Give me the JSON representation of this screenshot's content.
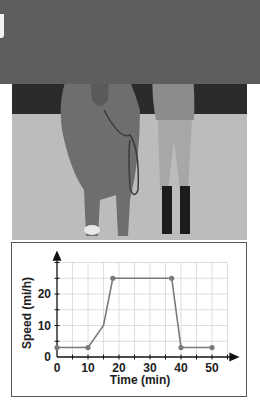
{
  "figure": {
    "photo_description": "Girl leading a horse on a grassy field",
    "photo_alt": "horse-and-rider-photo"
  },
  "chart_data": {
    "type": "line",
    "title": "",
    "xlabel": "Time (min)",
    "ylabel": "Speed (mi/h)",
    "x": [
      0,
      10,
      15,
      18,
      37,
      40,
      50
    ],
    "series": [
      {
        "name": "Speed",
        "values": [
          3,
          3,
          10,
          25,
          25,
          3,
          3
        ]
      }
    ],
    "markers_at": [
      0,
      10,
      18,
      37,
      40,
      50
    ],
    "xticks": [
      0,
      10,
      20,
      30,
      40,
      50
    ],
    "xtick_labels": [
      "0",
      "10",
      "20",
      "30",
      "40",
      "50"
    ],
    "yticks": [
      0,
      10,
      20
    ],
    "ytick_labels": [
      "0",
      "10",
      "20"
    ],
    "xlim": [
      0,
      55
    ],
    "ylim": [
      0,
      30
    ],
    "grid": true,
    "grid_step_x": 5,
    "grid_step_y": 5,
    "legend": null,
    "colors": {
      "line": "#7a7a7a",
      "marker": "#7a7a7a",
      "grid": "#d6d6d6",
      "axis": "#111111"
    }
  }
}
